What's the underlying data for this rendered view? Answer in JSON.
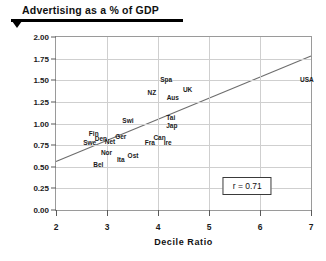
{
  "title": {
    "text": "Advertising as a % of GDP"
  },
  "chart_data": {
    "type": "scatter",
    "title": "Advertising as a % of GDP",
    "xlabel": "Decile Ratio",
    "ylabel": "",
    "xlim": [
      2,
      7
    ],
    "ylim": [
      0.0,
      2.0
    ],
    "grid": true,
    "legend": null,
    "xticks": [
      "2",
      "3",
      "4",
      "5",
      "6",
      "7"
    ],
    "xtick_values": [
      2,
      3,
      4,
      5,
      6,
      7
    ],
    "yticks": [
      "0.00",
      "0.25",
      "0.50",
      "0.75",
      "1.00",
      "1.25",
      "1.50",
      "1.75",
      "2.00"
    ],
    "ytick_values": [
      0.0,
      0.25,
      0.5,
      0.75,
      1.0,
      1.25,
      1.5,
      1.75,
      2.0
    ],
    "points": [
      {
        "label": "Fin",
        "x": 2.74,
        "y": 0.88
      },
      {
        "label": "Swe",
        "x": 2.66,
        "y": 0.78
      },
      {
        "label": "Den",
        "x": 2.88,
        "y": 0.82
      },
      {
        "label": "Net",
        "x": 3.06,
        "y": 0.79
      },
      {
        "label": "Nor",
        "x": 2.99,
        "y": 0.66
      },
      {
        "label": "Bel",
        "x": 2.83,
        "y": 0.52
      },
      {
        "label": "Ita",
        "x": 3.27,
        "y": 0.58
      },
      {
        "label": "Ost",
        "x": 3.51,
        "y": 0.62
      },
      {
        "label": "Ger",
        "x": 3.27,
        "y": 0.84
      },
      {
        "label": "Swi",
        "x": 3.41,
        "y": 1.03
      },
      {
        "label": "Fra",
        "x": 3.84,
        "y": 0.77
      },
      {
        "label": "Can",
        "x": 4.03,
        "y": 0.83
      },
      {
        "label": "Ire",
        "x": 4.19,
        "y": 0.78
      },
      {
        "label": "Tai",
        "x": 4.25,
        "y": 1.06
      },
      {
        "label": "Jap",
        "x": 4.27,
        "y": 0.97
      },
      {
        "label": "NZ",
        "x": 3.88,
        "y": 1.35
      },
      {
        "label": "Spa",
        "x": 4.16,
        "y": 1.5
      },
      {
        "label": "Aus",
        "x": 4.29,
        "y": 1.29
      },
      {
        "label": "UK",
        "x": 4.58,
        "y": 1.39
      },
      {
        "label": "USA",
        "x": 6.92,
        "y": 1.5
      }
    ],
    "trendline": {
      "x_start": 2.0,
      "y_start": 0.56,
      "x_end": 7.0,
      "y_end": 1.78
    },
    "annotation": {
      "text": "r = 0.71",
      "x": 5.75,
      "y": 0.28
    }
  }
}
